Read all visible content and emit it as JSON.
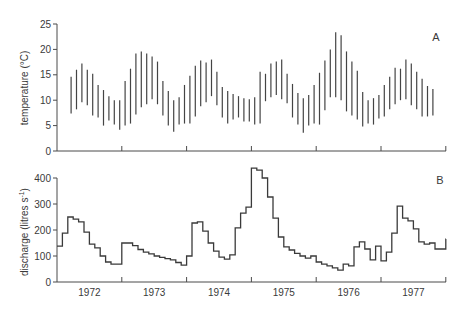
{
  "chart_data": [
    {
      "type": "range-bar",
      "panel_label": "A",
      "title": "",
      "xlabel": "",
      "ylabel": "temperature (°C)",
      "ylim": [
        0,
        25
      ],
      "yticks": [
        0,
        5,
        10,
        15,
        20,
        25
      ],
      "grid": false,
      "x_start": "1972-03",
      "x_interval": "monthly",
      "series": [
        {
          "name": "max",
          "values": [
            14.6,
            16.0,
            17.2,
            16.0,
            15.2,
            13.0,
            12.0,
            10.8,
            10.0,
            10.0,
            13.8,
            16.2,
            19.2,
            19.6,
            19.2,
            18.6,
            17.6,
            13.8,
            11.8,
            10.0,
            10.6,
            13.0,
            14.8,
            16.8,
            17.8,
            17.4,
            18.0,
            15.6,
            12.6,
            11.8,
            11.2,
            10.8,
            10.4,
            10.2,
            10.6,
            15.6,
            15.2,
            17.2,
            17.6,
            18.0,
            15.2,
            13.2,
            11.4,
            10.4,
            11.0,
            13.0,
            15.4,
            17.8,
            20.0,
            23.4,
            22.8,
            19.6,
            17.6,
            15.8,
            11.6,
            10.0,
            10.4,
            11.0,
            13.0,
            14.6,
            16.4,
            16.2,
            18.0,
            17.2,
            15.6,
            14.2,
            12.8,
            12.2
          ]
        },
        {
          "name": "min",
          "values": [
            7.4,
            8.2,
            9.6,
            9.0,
            7.0,
            6.6,
            5.0,
            6.0,
            5.2,
            4.2,
            5.0,
            5.4,
            7.2,
            8.6,
            9.2,
            10.2,
            9.2,
            7.0,
            5.0,
            3.8,
            5.2,
            5.4,
            5.4,
            6.8,
            8.8,
            9.6,
            10.8,
            9.0,
            6.6,
            5.4,
            6.2,
            6.6,
            5.8,
            5.8,
            5.2,
            5.4,
            9.8,
            10.6,
            11.0,
            10.2,
            9.4,
            6.6,
            5.2,
            3.6,
            5.0,
            5.4,
            5.2,
            8.0,
            10.6,
            10.6,
            10.0,
            7.8,
            7.0,
            6.2,
            4.8,
            5.4,
            5.2,
            6.4,
            6.8,
            8.2,
            9.2,
            10.0,
            10.2,
            9.0,
            8.2,
            6.8,
            6.8,
            7.0
          ]
        }
      ]
    },
    {
      "type": "step",
      "panel_label": "B",
      "title": "",
      "xlabel": "",
      "ylabel": "discharge (litres s⁻¹)",
      "ylim": [
        0,
        400
      ],
      "yticks": [
        0,
        100,
        200,
        300,
        400
      ],
      "grid": false,
      "x_start": "1972-01",
      "x_interval": "monthly",
      "series": [
        {
          "name": "discharge",
          "values": [
            138,
            188,
            250,
            242,
            231,
            192,
            146,
            131,
            100,
            77,
            69,
            69,
            150,
            150,
            140,
            125,
            115,
            108,
            100,
            95,
            90,
            85,
            75,
            65,
            100,
            227,
            231,
            196,
            150,
            119,
            96,
            88,
            104,
            208,
            265,
            288,
            438,
            430,
            400,
            327,
            246,
            173,
            135,
            123,
            110,
            100,
            92,
            100,
            77,
            69,
            62,
            54,
            46,
            69,
            62,
            135,
            154,
            127,
            85,
            138,
            81,
            115,
            188,
            292,
            246,
            235,
            204,
            154,
            146,
            150,
            127,
            127,
            165
          ]
        }
      ]
    }
  ],
  "x_axis": {
    "tick_labels": [
      "1972",
      "1973",
      "1974",
      "1975",
      "1976",
      "1977"
    ]
  },
  "panels": {
    "a": {
      "letter": "A",
      "ylabel": "temperature (°C)",
      "yticks": [
        "0",
        "5",
        "10",
        "15",
        "20",
        "25"
      ]
    },
    "b": {
      "letter": "B",
      "ylabel": "discharge (litres s",
      "ylabel_sup": "-1",
      "ylabel_close": ")",
      "yticks": [
        "0",
        "100",
        "200",
        "300",
        "400"
      ]
    }
  },
  "colors": {
    "line": "#3a3a3a",
    "axis": "#4a4a4a",
    "background": "#ffffff"
  }
}
